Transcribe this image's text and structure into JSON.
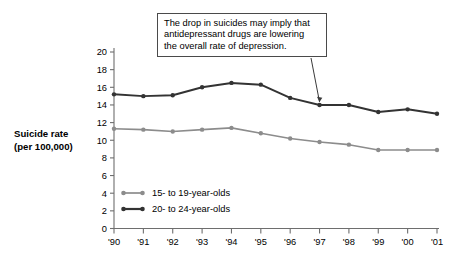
{
  "annotation": {
    "lines": [
      "The drop in suicides may imply that",
      "antidepressant drugs are lowering",
      "the overall rate of depression."
    ],
    "points_to_year": "'97"
  },
  "axis_title": {
    "line1": "Suicide rate",
    "line2": "(per 100,000)"
  },
  "colors": {
    "series_15_19": "#8c8c8c",
    "series_20_24": "#333333",
    "axis": "#6e6e6e",
    "callout_border": "#4a4a4a",
    "background": "#ffffff"
  },
  "chart_data": {
    "type": "line",
    "title": "",
    "xlabel": "",
    "ylabel": "Suicide rate (per 100,000)",
    "categories": [
      "'90",
      "'91",
      "'92",
      "'93",
      "'94",
      "'95",
      "'96",
      "'97",
      "'98",
      "'99",
      "'00",
      "'01"
    ],
    "ylim": [
      0,
      20
    ],
    "ytick_step": 2,
    "yticks": [
      "0",
      "2",
      "4",
      "6",
      "8",
      "10",
      "12",
      "14",
      "16",
      "18",
      "20"
    ],
    "grid": false,
    "legend_position": "inside-bottom-left",
    "series": [
      {
        "name": "15- to 19-year-olds",
        "color": "#8c8c8c",
        "values": [
          11.3,
          11.2,
          11.0,
          11.2,
          11.4,
          10.8,
          10.2,
          9.8,
          9.5,
          8.9,
          8.9,
          8.9
        ]
      },
      {
        "name": "20- to 24-year-olds",
        "color": "#333333",
        "values": [
          15.2,
          15.0,
          15.1,
          16.0,
          16.5,
          16.3,
          14.8,
          14.0,
          14.0,
          13.2,
          13.5,
          13.0
        ]
      }
    ]
  }
}
